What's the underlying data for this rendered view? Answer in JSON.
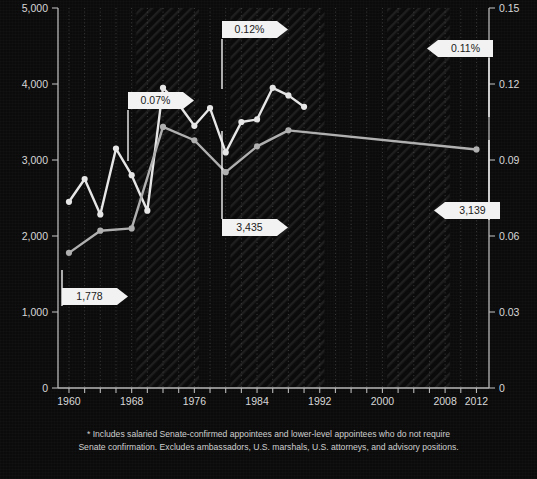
{
  "chart_data": {
    "type": "line",
    "title": "",
    "subtitle": "",
    "xlabel": "",
    "ylabel": "Number of political appointees",
    "y2label": "Appointees as share of federal civilian workforce (%)",
    "xlim": [
      1958,
      2014
    ],
    "ylim": [
      0,
      5000
    ],
    "y2lim": [
      0,
      0.15
    ],
    "grid": true,
    "legend_position": "none",
    "background": "#0b0b0b",
    "x": [
      1960,
      1962,
      1964,
      1966,
      1968,
      1970,
      1972,
      1974,
      1976,
      1978,
      1980,
      1982,
      1984,
      1986,
      1988,
      1990,
      1992,
      1994,
      1996,
      1998,
      2000,
      2002,
      2004,
      2006,
      2008,
      2010,
      2012
    ],
    "xticks": [
      1960,
      1968,
      1976,
      1984,
      1992,
      2000,
      2008,
      2012
    ],
    "xticklabels": [
      "1960",
      "1968",
      "1976",
      "1984",
      "1992",
      "2000",
      "2008",
      "2012"
    ],
    "yticks": [
      0,
      1000,
      2000,
      3000,
      4000,
      5000
    ],
    "yticklabels": [
      "0",
      "1,000",
      "2,000",
      "3,000",
      "4,000",
      "5,000"
    ],
    "y2ticks": [
      0,
      0.03,
      0.06,
      0.09,
      0.12,
      0.15
    ],
    "y2ticklabels": [
      "0",
      "0.03",
      "0.06",
      "0.09",
      "0.12",
      "0.15"
    ],
    "series": [
      {
        "name": "Appointees as share of federal civilian workforce",
        "axis": "right",
        "color": "#e6e6e6",
        "values": [
          0.0735,
          0.0825,
          0.0685,
          0.0945,
          0.08,
          0.084,
          0.072,
          0.1185,
          0.112,
          0.1035,
          0.1105,
          0.1045,
          0.093,
          0.105,
          0.106,
          0.1185,
          0.1155,
          0.111,
          0.111,
          0.111,
          0.111,
          0.111,
          0.111,
          0.111,
          0.111,
          0.111,
          0.111
        ]
      },
      {
        "name": "Number of political appointees",
        "axis": "left",
        "color": "#b0b0b0",
        "values": [
          1778,
          2070,
          2100,
          2670,
          2400,
          3435,
          3260,
          3215,
          3410,
          3105,
          2840,
          3180,
          3195,
          3390,
          3139,
          3139,
          3139,
          3139,
          3139,
          3139,
          3139,
          3139,
          3139,
          3139,
          3139,
          3139,
          3139
        ]
      }
    ],
    "pct_points": [
      {
        "year": 1960,
        "value": 0.0735
      },
      {
        "year": 1962,
        "value": 0.0825
      },
      {
        "year": 1964,
        "value": 0.0685
      },
      {
        "year": 1966,
        "value": 0.0945
      },
      {
        "year": 1968,
        "value": 0.084
      },
      {
        "year": 1970,
        "value": 0.07
      },
      {
        "year": 1972,
        "value": 0.1185
      },
      {
        "year": 1974,
        "value": 0.112
      },
      {
        "year": 1976,
        "value": 0.1035
      },
      {
        "year": 1978,
        "value": 0.1105
      },
      {
        "year": 1980,
        "value": 0.093
      },
      {
        "year": 1982,
        "value": 0.105
      },
      {
        "year": 1984,
        "value": 0.106
      },
      {
        "year": 1986,
        "value": 0.1185
      },
      {
        "year": 1988,
        "value": 0.1155
      },
      {
        "year": 1990,
        "value": 0.111
      }
    ],
    "count_points": [
      {
        "year": 1960,
        "value": 1778
      },
      {
        "year": 1964,
        "value": 2070
      },
      {
        "year": 1968,
        "value": 2100
      },
      {
        "year": 1972,
        "value": 3435
      },
      {
        "year": 1976,
        "value": 3260
      },
      {
        "year": 1980,
        "value": 2840
      },
      {
        "year": 1984,
        "value": 3180
      },
      {
        "year": 1988,
        "value": 3390
      },
      {
        "year": 2012,
        "value": 3139
      }
    ],
    "annotations": [
      {
        "id": "pct-1968",
        "label": "0.07%",
        "arrow": "right",
        "series": "percent"
      },
      {
        "id": "pct-1980",
        "label": "0.12%",
        "arrow": "right",
        "series": "percent"
      },
      {
        "id": "pct-2012",
        "label": "0.11%",
        "arrow": "left",
        "series": "percent"
      },
      {
        "id": "count-1960",
        "label": "1,778",
        "arrow": "right",
        "series": "count"
      },
      {
        "id": "count-1980",
        "label": "3,435",
        "arrow": "right",
        "series": "count"
      },
      {
        "id": "count-2012",
        "label": "3,139",
        "arrow": "left",
        "series": "count"
      }
    ],
    "footnote_lines": [
      "* Includes salaried Senate-confirmed appointees and lower-level appointees who do not require",
      "Senate confirmation. Excludes ambassadors, U.S. marshals, U.S. attorneys, and advisory positions."
    ]
  },
  "colors": {
    "background": "#0b0b0b",
    "axis": "#b9b9b9",
    "grid": "#555555",
    "series_percent": "#e6e6e6",
    "series_count": "#b0b0b0",
    "callout_fill": "#f2f2f2",
    "callout_text": "#1a1a1a",
    "tick_text": "#d8d8d8",
    "footnote_text": "#cfcfcf"
  }
}
